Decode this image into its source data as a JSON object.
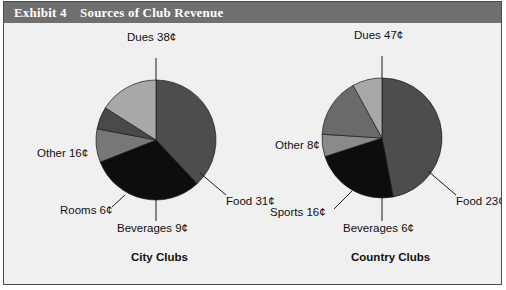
{
  "header": {
    "exhibit_label": "Exhibit 4",
    "title": "Sources of Club Revenue",
    "bar_color": "#6f6f6f",
    "text_color": "#ffffff"
  },
  "panel": {
    "background": "#f0f0f0",
    "border_color": "#4a4a4a"
  },
  "charts": {
    "left": {
      "title": "City Clubs",
      "labels": {
        "dues": "Dues 38¢",
        "food": "Food 31¢",
        "beverages": "Beverages 9¢",
        "rooms": "Rooms 6¢",
        "other": "Other 16¢"
      }
    },
    "right": {
      "title": "Country Clubs",
      "labels": {
        "dues": "Dues 47¢",
        "food": "Food 23¢",
        "beverages": "Beverages 6¢",
        "sports": "Sports 16¢",
        "other": "Other 8¢"
      }
    }
  },
  "chart_data": [
    {
      "type": "pie",
      "title": "City Clubs",
      "unit": "cents per revenue dollar",
      "categories": [
        "Dues",
        "Food",
        "Beverages",
        "Rooms",
        "Other"
      ],
      "values": [
        38,
        31,
        9,
        6,
        16
      ],
      "labels": [
        "Dues 38¢",
        "Food 31¢",
        "Beverages 9¢",
        "Rooms 6¢",
        "Other 16¢"
      ],
      "colors": [
        "#4d4d4d",
        "#0d0d0d",
        "#777777",
        "#4a4a4a",
        "#a8a8a8"
      ],
      "legend": "none",
      "start_angle_deg": 0,
      "direction": "clockwise"
    },
    {
      "type": "pie",
      "title": "Country Clubs",
      "unit": "cents per revenue dollar",
      "categories": [
        "Dues",
        "Food",
        "Beverages",
        "Sports",
        "Other"
      ],
      "values": [
        47,
        23,
        6,
        16,
        8
      ],
      "labels": [
        "Dues 47¢",
        "Food 23¢",
        "Beverages 6¢",
        "Sports 16¢",
        "Other 8¢"
      ],
      "colors": [
        "#4d4d4d",
        "#0d0d0d",
        "#8a8a8a",
        "#6a6a6a",
        "#a8a8a8"
      ],
      "legend": "none",
      "start_angle_deg": 0,
      "direction": "clockwise"
    }
  ]
}
